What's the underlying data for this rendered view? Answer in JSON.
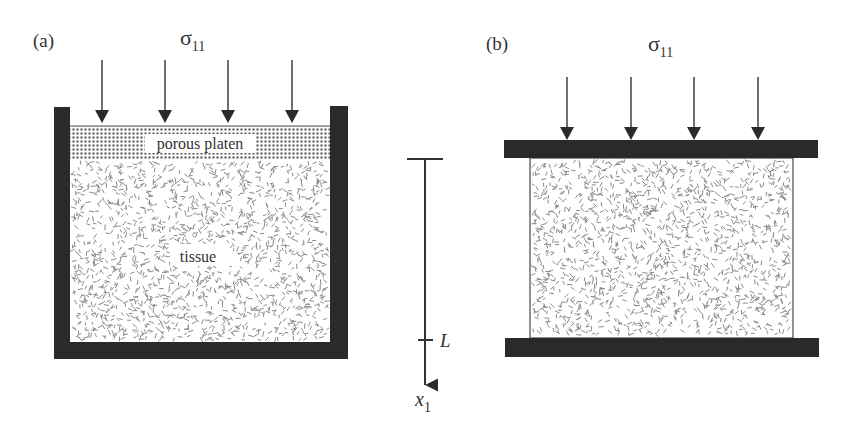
{
  "figure": {
    "panels": [
      {
        "id": "a",
        "panel_label": "(a)",
        "load_symbol": "σ",
        "load_subscript": "11",
        "arrow_count": 4,
        "layers": {
          "platen_label": "porous platen",
          "tissue_label": "tissue"
        },
        "description": "Confined compression: tissue in a rigid chamber under a porous platen"
      },
      {
        "id": "b",
        "panel_label": "(b)",
        "load_symbol": "σ",
        "load_subscript": "11",
        "arrow_count": 4,
        "description": "Unconfined compression: tissue between two impermeable plates"
      }
    ],
    "axis": {
      "variable": "x",
      "variable_subscript": "1",
      "tick_label": "L",
      "direction": "down"
    }
  },
  "colors": {
    "wall": "#2a2a2a",
    "line": "#333333",
    "tissue_speck": "#8a8a8a",
    "platen_dot": "#4a4a4a",
    "background": "#ffffff"
  }
}
